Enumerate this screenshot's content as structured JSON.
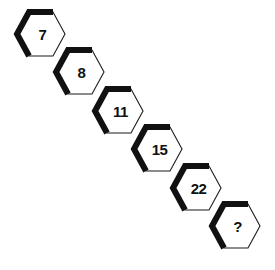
{
  "puzzle": {
    "type": "number-sequence",
    "shape": "hexagon",
    "background_color": "#ffffff",
    "outline_color": "#1a1a1a",
    "shadow_color": "#111111",
    "text_color": "#111111",
    "cells": [
      {
        "label": "7",
        "x": 16,
        "y": 11,
        "name": "hexagon-7"
      },
      {
        "label": "8",
        "x": 55,
        "y": 49,
        "name": "hexagon-8"
      },
      {
        "label": "11",
        "x": 94,
        "y": 88,
        "name": "hexagon-11"
      },
      {
        "label": "15",
        "x": 133,
        "y": 126,
        "name": "hexagon-15"
      },
      {
        "label": "22",
        "x": 172,
        "y": 165,
        "name": "hexagon-22"
      },
      {
        "label": "?",
        "x": 211,
        "y": 203,
        "name": "hexagon-answer"
      }
    ]
  },
  "chart_data": {
    "type": "table",
    "title": "",
    "categories": [
      "1",
      "2",
      "3",
      "4",
      "5",
      "6"
    ],
    "values": [
      7,
      8,
      11,
      15,
      22,
      null
    ],
    "labels": [
      "7",
      "8",
      "11",
      "15",
      "22",
      "?"
    ],
    "xlabel": "",
    "ylabel": ""
  }
}
